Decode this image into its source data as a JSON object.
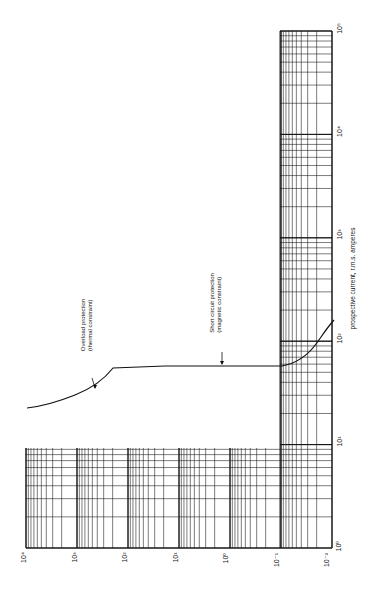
{
  "chart_data": {
    "type": "line",
    "orientation": "rotated 90° counter-clockwise (time axis runs along bottom, current axis along right side)",
    "title": "",
    "xlabel": "prospective current, r.m.s. amperes",
    "ylabel": "",
    "x_scale": "log",
    "y_scale": "log",
    "x_tick_labels": [
      "10⁰",
      "10¹",
      "10²",
      "10³",
      "10⁴",
      "10⁵"
    ],
    "y_tick_labels": [
      "10⁴",
      "10³",
      "10²",
      "10¹",
      "10⁰",
      "10⁻¹",
      "10⁻²"
    ],
    "xlim": [
      1,
      100000
    ],
    "ylim": [
      0.01,
      10000
    ],
    "grid": true,
    "legend": null,
    "series": [
      {
        "name": "Circuit-breaker tripping characteristic",
        "x": [
          10,
          12,
          15,
          20,
          30,
          45,
          50,
          60,
          100,
          120,
          150,
          200,
          250
        ],
        "y": [
          10000,
          3000,
          700,
          150,
          25,
          5,
          5,
          5,
          5,
          0.1,
          0.03,
          0.015,
          0.012
        ]
      }
    ],
    "annotations": [
      {
        "text": "Overload protection",
        "subtext": "(thermal constraint)"
      },
      {
        "text": "Short circuit protection",
        "subtext": "(magnetic constraint)"
      }
    ]
  },
  "labels": {
    "x_axis_title": "prospective current, r.m.s. amperes",
    "x_ticks": [
      "10⁵",
      "10⁴",
      "10³",
      "10²",
      "10¹",
      "10⁰"
    ],
    "y_ticks": [
      "10⁴",
      "10³",
      "10²",
      "10¹",
      "10⁰",
      "10⁻¹",
      "10⁻²"
    ],
    "ann_overload_1": "Overload protection",
    "ann_overload_2": "(thermal constraint)",
    "ann_short_1": "Short circuit protection",
    "ann_short_2": "(magnetic constraint)"
  },
  "colors": {
    "ink": "#111111",
    "background": "#ffffff"
  }
}
